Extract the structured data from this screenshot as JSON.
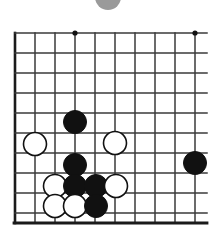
{
  "figure": {
    "kind": "go-board-diagram",
    "width": 221,
    "height": 249,
    "background_color": "#ffffff",
    "line_color": "#3a3a3a",
    "border_color": "#1a1a1a",
    "black_stone_color": "#111111",
    "white_stone_fill": "#ffffff",
    "white_stone_outline": "#111111",
    "star_point_color": "#111111",
    "cut_marker_color": "#9a9a9a"
  },
  "board": {
    "grid": {
      "origin_x": 15,
      "origin_y": 33,
      "spacing": 20,
      "columns": 10,
      "rows": 10,
      "bottom_edge_y": 223,
      "thick_left_edge": true,
      "thick_bottom_edge": true
    },
    "star_points": [
      {
        "x": 75,
        "y": 33
      },
      {
        "x": 195,
        "y": 33
      },
      {
        "x": 195,
        "y": 163
      }
    ],
    "stone_radius": 11.5,
    "stones": [
      {
        "color": "black",
        "x": 75,
        "y": 122,
        "label": "black-stone-upper-center"
      },
      {
        "color": "white",
        "x": 35,
        "y": 144,
        "label": "white-stone-left-edge"
      },
      {
        "color": "white",
        "x": 115,
        "y": 143,
        "label": "white-stone-right-of-black"
      },
      {
        "color": "black",
        "x": 75,
        "y": 165,
        "label": "black-stone-center"
      },
      {
        "color": "black",
        "x": 195,
        "y": 163,
        "label": "black-stone-right-side"
      },
      {
        "color": "white",
        "x": 55,
        "y": 186,
        "label": "white-stone-lower-left"
      },
      {
        "color": "black",
        "x": 75,
        "y": 186,
        "label": "black-stone-lower-center"
      },
      {
        "color": "black",
        "x": 96,
        "y": 186,
        "label": "black-stone-lower-right"
      },
      {
        "color": "white",
        "x": 116,
        "y": 186,
        "label": "white-stone-lower-far-right"
      },
      {
        "color": "white",
        "x": 55,
        "y": 206,
        "label": "white-stone-bottom-left"
      },
      {
        "color": "white",
        "x": 75,
        "y": 206,
        "label": "white-stone-bottom-center"
      },
      {
        "color": "black",
        "x": 96,
        "y": 206,
        "label": "black-stone-bottom-right"
      }
    ]
  },
  "cut_off_marker": {
    "cx": 108,
    "cy": -3,
    "r": 13,
    "fill": "#9a9a9a",
    "description": "partially-visible-gray-circle-at-top"
  }
}
